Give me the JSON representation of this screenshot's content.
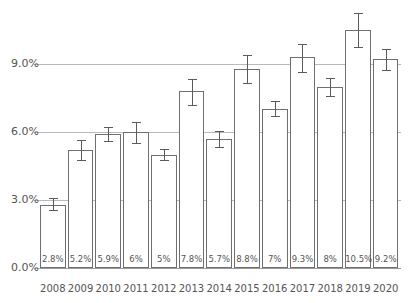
{
  "chart_data": {
    "type": "bar",
    "title": "",
    "subtitle": "",
    "xlabel": "",
    "ylabel": "",
    "categories": [
      "2008",
      "2009",
      "2010",
      "2011",
      "2012",
      "2013",
      "2014",
      "2015",
      "2016",
      "2017",
      "2018",
      "2019",
      "2020"
    ],
    "values": [
      2.8,
      5.2,
      5.9,
      6.0,
      5.0,
      7.8,
      5.7,
      8.8,
      7.0,
      9.3,
      8.0,
      10.5,
      9.2
    ],
    "value_labels": [
      "2.8%",
      "5.2%",
      "5.9%",
      "6%",
      "5%",
      "7.8%",
      "5.7%",
      "8.8%",
      "7%",
      "9.3%",
      "8%",
      "10.5%",
      "9.2%"
    ],
    "error_low": [
      2.55,
      4.75,
      5.6,
      5.5,
      4.75,
      7.2,
      5.35,
      8.15,
      6.7,
      8.65,
      7.6,
      9.75,
      8.75
    ],
    "error_high": [
      3.1,
      5.65,
      6.2,
      6.45,
      5.25,
      8.35,
      6.05,
      9.4,
      7.35,
      9.9,
      8.4,
      11.25,
      9.65
    ],
    "error_label": "error bars",
    "ylim": [
      0.0,
      11.8
    ],
    "ytick_values": [
      0.0,
      3.0,
      6.0,
      9.0
    ],
    "ytick_labels": [
      "0.0%",
      "3.0%",
      "6.0%",
      "9.0%"
    ],
    "grid": true,
    "grid_axis": "y",
    "legend": false,
    "legend_position": "none",
    "bar_fill": "#ffffff",
    "bar_stroke": "#6f6f6f",
    "grid_color": "#b9b9b9",
    "text_color": "#555555",
    "background": "#ffffff"
  }
}
